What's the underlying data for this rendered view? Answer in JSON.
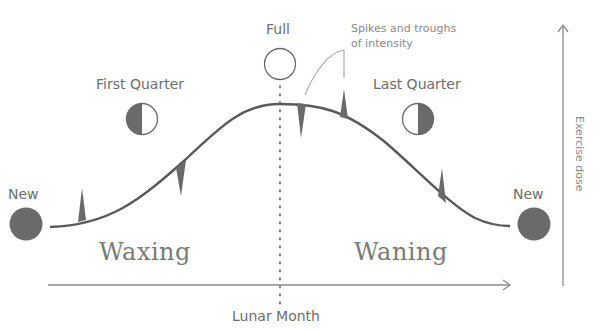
{
  "diagram": {
    "title": "",
    "x_axis": {
      "label": "Lunar Month",
      "direction": "right"
    },
    "y_axis": {
      "label": "Exercise dose",
      "direction": "up"
    },
    "annotation": {
      "line1": "Spikes and troughs",
      "line2": "of intensity"
    },
    "phases": {
      "new_left": "New",
      "first_quarter": "First Quarter",
      "full": "Full",
      "last_quarter": "Last Quarter",
      "new_right": "New"
    },
    "regions": {
      "left": "Waxing",
      "right": "Waning"
    },
    "colors": {
      "curve": "#5a5a5a",
      "moon_dark": "#6a6a6a",
      "moon_outline": "#6a6a6a",
      "axis": "#7a7a7a",
      "text": "#6e6e6e"
    },
    "curve_shape": "sine-like rise from New to peak at Full, fall to New",
    "spikes": [
      {
        "position": "early waxing",
        "type": "spike-up"
      },
      {
        "position": "mid waxing",
        "type": "trough-down"
      },
      {
        "position": "just after full",
        "type": "trough-down"
      },
      {
        "position": "early waning",
        "type": "spike-up"
      },
      {
        "position": "late waning",
        "type": "spike-up"
      }
    ]
  }
}
